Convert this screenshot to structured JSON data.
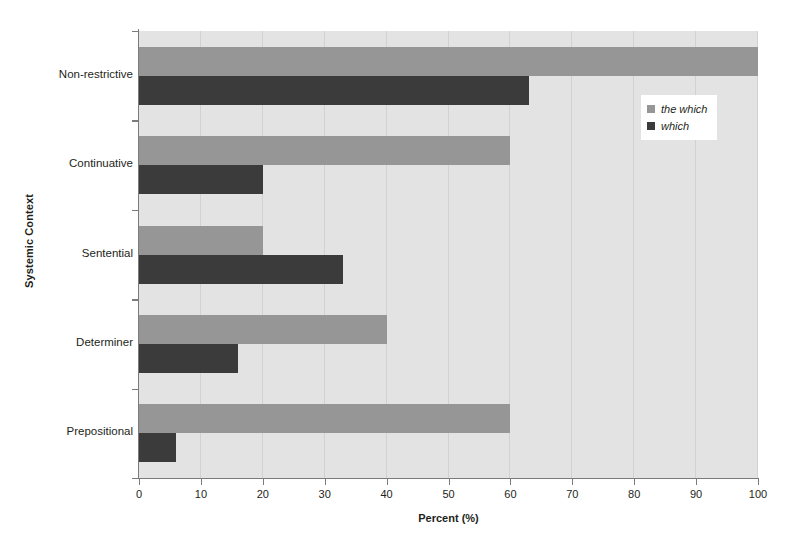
{
  "chart_data": {
    "type": "bar",
    "orientation": "horizontal",
    "title": "",
    "xlabel": "Percent (%)",
    "ylabel": "Systemic Context",
    "xlim": [
      0,
      100
    ],
    "xticks": [
      0,
      10,
      20,
      30,
      40,
      50,
      60,
      70,
      80,
      90,
      100
    ],
    "grid": "vertical",
    "legend_position": "upper-right-inside",
    "categories": [
      "Non-restrictive",
      "Continuative",
      "Sentential",
      "Determiner",
      "Prepositional"
    ],
    "series": [
      {
        "name": "the which",
        "color": "#969696",
        "values": [
          100,
          60,
          20,
          40,
          60
        ]
      },
      {
        "name": "which",
        "color": "#3b3b3b",
        "values": [
          63,
          20,
          33,
          16,
          6
        ]
      }
    ]
  },
  "axes": {
    "x": {
      "title": "Percent (%)",
      "tick_labels": [
        "0",
        "10",
        "20",
        "30",
        "40",
        "50",
        "60",
        "70",
        "80",
        "90",
        "100"
      ]
    },
    "y": {
      "title": "Systemic Context",
      "tick_labels": [
        "Non-restrictive",
        "Continuative",
        "Sentential",
        "Determiner",
        "Prepositional"
      ]
    }
  },
  "legend": {
    "items": [
      {
        "label": "the which",
        "color": "#969696"
      },
      {
        "label": "which",
        "color": "#3b3b3b"
      }
    ]
  },
  "colors": {
    "plot_background": "#e3e3e3",
    "gridline": "#d2d2d2",
    "axis_line": "#7b7b7b",
    "series_light": "#969696",
    "series_dark": "#3b3b3b",
    "text": "#231f20"
  }
}
